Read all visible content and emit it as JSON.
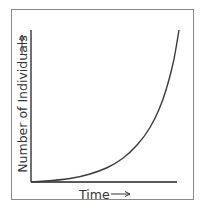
{
  "chart_data": {
    "type": "line",
    "title": "",
    "xlabel": "Time",
    "ylabel": "Number of Individuals",
    "xlabel_arrow": "⟶",
    "ylabel_arrow": "⟶",
    "grid": false,
    "legend": null,
    "ticks": "none",
    "series": [
      {
        "name": "population",
        "points_px": [
          [
            31,
            182
          ],
          [
            60,
            180
          ],
          [
            80,
            177
          ],
          [
            100,
            171
          ],
          [
            115,
            164
          ],
          [
            130,
            153
          ],
          [
            145,
            136
          ],
          [
            155,
            119
          ],
          [
            163,
            100
          ],
          [
            169,
            80
          ],
          [
            174,
            60
          ],
          [
            177,
            42
          ],
          [
            179,
            30
          ]
        ]
      }
    ],
    "colors": {
      "axis": "#222222",
      "curve": "#3a3a3a",
      "frame": "#8a8a8a"
    }
  }
}
